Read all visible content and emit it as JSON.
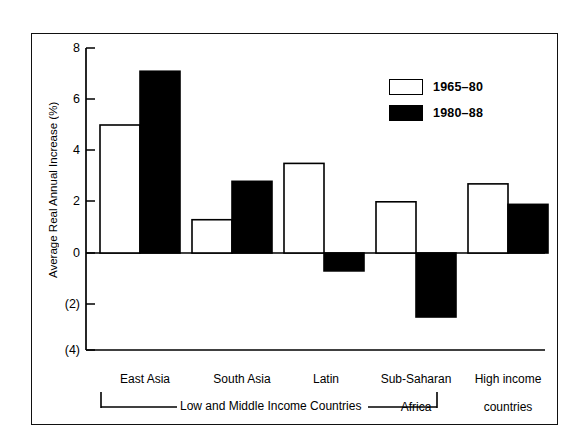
{
  "chart_data": {
    "type": "bar",
    "title": "",
    "xlabel": "",
    "ylabel": "Average Real Annual Increase (%)",
    "ylim": [
      -4,
      8
    ],
    "ytick_values": [
      8,
      6,
      4,
      2,
      0,
      -2,
      -4
    ],
    "ytick_labels": [
      "8",
      "6",
      "4",
      "2",
      "0",
      "(2)",
      "(4)"
    ],
    "grid": false,
    "legend_position": "top-right",
    "categories": [
      "East Asia",
      "South Asia",
      "Latin\nAmerica",
      "Sub-Saharan\nAfrica",
      "High income\ncountries"
    ],
    "series": [
      {
        "name": "1965–80",
        "fill": "#ffffff",
        "stroke": "#000000",
        "values": [
          5.0,
          1.3,
          3.5,
          2.0,
          2.7
        ]
      },
      {
        "name": "1980–88",
        "fill": "#000000",
        "stroke": "#000000",
        "values": [
          7.1,
          2.8,
          -0.7,
          -2.5,
          1.9
        ]
      }
    ],
    "annotations": [
      {
        "name": "group-bracket",
        "text": "Low and Middle Income Countries",
        "spans_categories": [
          "East Asia",
          "South Asia",
          "Latin America",
          "Sub-Saharan Africa"
        ]
      }
    ]
  },
  "axis": {
    "y_title": "Average Real Annual Increase (%)",
    "ticks": [
      {
        "label": "8",
        "value": 8
      },
      {
        "label": "6",
        "value": 6
      },
      {
        "label": "4",
        "value": 4
      },
      {
        "label": "2",
        "value": 2
      },
      {
        "label": "0",
        "value": 0
      },
      {
        "label": "(2)",
        "value": -2
      },
      {
        "label": "(4)",
        "value": -4
      }
    ]
  },
  "legend": {
    "items": [
      {
        "label": "1965–80",
        "style": "hollow"
      },
      {
        "label": "1980–88",
        "style": "filled"
      }
    ]
  },
  "categories": [
    {
      "line1": "East Asia",
      "line2": ""
    },
    {
      "line1": "South Asia",
      "line2": ""
    },
    {
      "line1": "Latin",
      "line2": "America"
    },
    {
      "line1": "Sub-Saharan",
      "line2": "Africa"
    },
    {
      "line1": "High income",
      "line2": "countries"
    }
  ],
  "bracket": {
    "caption": "Low and Middle Income Countries"
  },
  "colors": {
    "ink": "#000000",
    "paper": "#ffffff",
    "series_1965_80": "#ffffff",
    "series_1980_88": "#000000"
  }
}
